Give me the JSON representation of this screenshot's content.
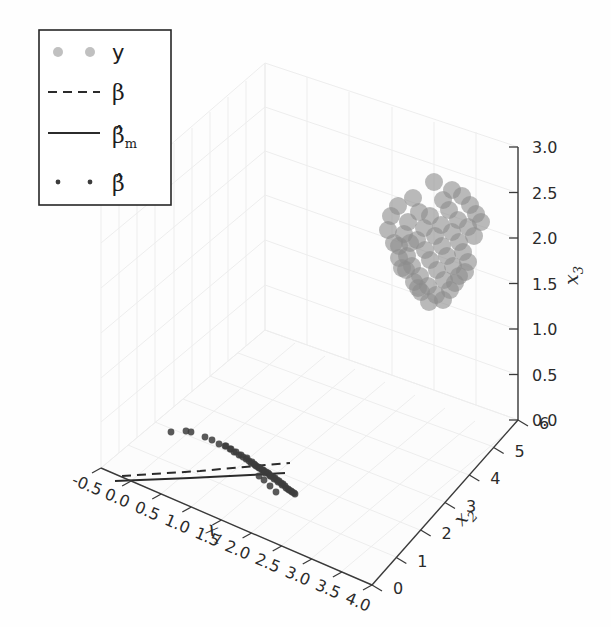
{
  "figure": {
    "background": "#fefefe",
    "pane_color": "#fbfbfb",
    "grid_color": "#ececec",
    "axis_color": "#3a3a3a",
    "text_color": "#2b2b2b"
  },
  "legend": {
    "border_color": "#262626",
    "background": "#ffffff",
    "entries": [
      {
        "label": "y",
        "handle": "marker-dots-large",
        "color": "#9a9a9a",
        "marker_size": 7
      },
      {
        "label": "β",
        "handle": "dashed-line",
        "color": "#2b2b2b"
      },
      {
        "label": "β̂m",
        "handle": "solid-line",
        "color": "#2b2b2b"
      },
      {
        "label": "β̂",
        "handle": "marker-dots-small",
        "color": "#3c3c3c",
        "marker_size": 2.5
      }
    ]
  },
  "chart_data": {
    "type": "scatter",
    "projection": "3d",
    "title": "",
    "grid": true,
    "legend_position": "upper left",
    "axes": {
      "x1": {
        "label": "x1",
        "ticks": [
          -0.5,
          0.0,
          0.5,
          1.0,
          1.5,
          2.0,
          2.5,
          3.0,
          3.5,
          4.0
        ],
        "tick_labels": [
          "-0.5",
          "0.0",
          "0.5",
          "1.0",
          "1.5",
          "2.0",
          "2.5",
          "3.0",
          "3.5",
          "4.0"
        ],
        "lim": [
          -0.5,
          4.0
        ]
      },
      "x2": {
        "label": "x2",
        "ticks": [
          0,
          1,
          2,
          3,
          4,
          5,
          6
        ],
        "tick_labels": [
          "0",
          "1",
          "2",
          "3",
          "4",
          "5",
          "6"
        ],
        "lim": [
          0,
          6
        ]
      },
      "x3": {
        "label": "x3",
        "ticks": [
          0.0,
          0.5,
          1.0,
          1.5,
          2.0,
          2.5,
          3.0
        ],
        "tick_labels": [
          "0.0",
          "0.5",
          "1.0",
          "1.5",
          "2.0",
          "2.5",
          "3.0"
        ],
        "lim": [
          0.0,
          3.0
        ]
      }
    },
    "series": [
      {
        "name": "y",
        "kind": "scatter",
        "color": "#8c8c8c",
        "alpha": 0.6,
        "marker_size": 9,
        "points_px": [
          [
            413,
            198
          ],
          [
            434,
            182
          ],
          [
            452,
            190
          ],
          [
            398,
            206
          ],
          [
            443,
            200
          ],
          [
            419,
            212
          ],
          [
            462,
            196
          ],
          [
            408,
            222
          ],
          [
            430,
            216
          ],
          [
            449,
            210
          ],
          [
            470,
            205
          ],
          [
            391,
            216
          ],
          [
            404,
            234
          ],
          [
            424,
            228
          ],
          [
            441,
            225
          ],
          [
            458,
            220
          ],
          [
            476,
            214
          ],
          [
            388,
            230
          ],
          [
            399,
            246
          ],
          [
            417,
            240
          ],
          [
            435,
            236
          ],
          [
            452,
            232
          ],
          [
            468,
            227
          ],
          [
            481,
            222
          ],
          [
            394,
            243
          ],
          [
            407,
            256
          ],
          [
            425,
            250
          ],
          [
            442,
            246
          ],
          [
            459,
            242
          ],
          [
            474,
            236
          ],
          [
            399,
            258
          ],
          [
            412,
            266
          ],
          [
            430,
            260
          ],
          [
            447,
            256
          ],
          [
            463,
            252
          ],
          [
            406,
            270
          ],
          [
            420,
            276
          ],
          [
            437,
            270
          ],
          [
            453,
            266
          ],
          [
            468,
            262
          ],
          [
            414,
            282
          ],
          [
            428,
            286
          ],
          [
            444,
            280
          ],
          [
            459,
            276
          ],
          [
            421,
            292
          ],
          [
            436,
            295
          ],
          [
            450,
            290
          ],
          [
            429,
            302
          ],
          [
            443,
            300
          ],
          [
            418,
            288
          ],
          [
            455,
            283
          ],
          [
            465,
            272
          ],
          [
            402,
            268
          ],
          [
            410,
            243
          ]
        ]
      },
      {
        "name": "β̂",
        "kind": "scatter",
        "color": "#3c3c3c",
        "alpha": 0.85,
        "marker_size": 3.4,
        "points_px": [
          [
            171,
            432
          ],
          [
            186,
            431
          ],
          [
            191,
            432
          ],
          [
            205,
            437
          ],
          [
            212,
            440
          ],
          [
            219,
            444
          ],
          [
            225,
            446
          ],
          [
            230,
            449
          ],
          [
            234,
            452
          ],
          [
            239,
            455
          ],
          [
            243,
            457
          ],
          [
            246,
            459
          ],
          [
            249,
            461
          ],
          [
            251,
            463
          ],
          [
            254,
            464
          ],
          [
            256,
            466
          ],
          [
            258,
            467
          ],
          [
            260,
            468
          ],
          [
            262,
            470
          ],
          [
            264,
            471
          ],
          [
            266,
            472
          ],
          [
            268,
            473
          ],
          [
            269,
            474
          ],
          [
            271,
            476
          ],
          [
            273,
            477
          ],
          [
            275,
            478
          ],
          [
            277,
            480
          ],
          [
            279,
            481
          ],
          [
            281,
            483
          ],
          [
            283,
            484
          ],
          [
            285,
            486
          ],
          [
            252,
            462
          ],
          [
            255,
            465
          ],
          [
            259,
            468
          ],
          [
            263,
            470
          ],
          [
            247,
            458
          ],
          [
            241,
            455
          ],
          [
            236,
            452
          ],
          [
            231,
            449
          ],
          [
            226,
            446
          ],
          [
            265,
            473
          ],
          [
            270,
            476
          ],
          [
            274,
            479
          ],
          [
            278,
            482
          ],
          [
            282,
            485
          ],
          [
            286,
            488
          ],
          [
            289,
            490
          ],
          [
            292,
            492
          ],
          [
            295,
            494
          ],
          [
            288,
            489
          ],
          [
            291,
            491
          ],
          [
            294,
            493
          ],
          [
            270,
            486
          ],
          [
            276,
            492
          ],
          [
            264,
            480
          ],
          [
            259,
            476
          ]
        ]
      }
    ],
    "lines": [
      {
        "name": "β",
        "style": "dashed",
        "color": "#2b2b2b",
        "width": 2,
        "points_px": [
          [
            122,
            476
          ],
          [
            200,
            471
          ],
          [
            255,
            466
          ],
          [
            290,
            463
          ]
        ]
      },
      {
        "name": "β̂m",
        "style": "solid",
        "color": "#2b2b2b",
        "width": 2,
        "points_px": [
          [
            115,
            481
          ],
          [
            190,
            478
          ],
          [
            250,
            475
          ],
          [
            285,
            473
          ]
        ]
      }
    ]
  }
}
